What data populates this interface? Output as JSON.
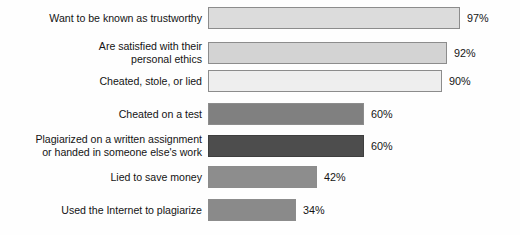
{
  "chart_data": {
    "type": "bar",
    "orientation": "horizontal",
    "title": "",
    "subtitle": "",
    "xlabel": "",
    "ylabel": "",
    "xlim": [
      0,
      100
    ],
    "grid": false,
    "legend": null,
    "units": "%",
    "categories": [
      "Want to be known as trustworthy",
      "Are satisfied with their\npersonal ethics",
      "Cheated, stole, or lied",
      "Cheated on a test",
      "Plagiarized on a written assignment\nor handed in someone else's work",
      "Lied to save money",
      "Used the Internet to plagiarize"
    ],
    "values": [
      97,
      92,
      90,
      60,
      60,
      42,
      34
    ],
    "value_labels": [
      "97%",
      "92%",
      "90%",
      "60%",
      "60%",
      "42%",
      "34%"
    ],
    "bar_colors": [
      "#dcdcdc",
      "#d3d3d3",
      "#eeeeee",
      "#808080",
      "#4d4d4d",
      "#8d8d8d",
      "#8a8a8a"
    ],
    "bars": [
      {
        "label": "Want to be known as trustworthy",
        "value": 97,
        "value_label": "97%",
        "color": "#dcdcdc",
        "dark": false
      },
      {
        "label": "Are satisfied with their\npersonal ethics",
        "value": 92,
        "value_label": "92%",
        "color": "#d3d3d3",
        "dark": false
      },
      {
        "label": "Cheated, stole, or lied",
        "value": 90,
        "value_label": "90%",
        "color": "#eeeeee",
        "dark": false
      },
      {
        "label": "Cheated on a test",
        "value": 60,
        "value_label": "60%",
        "color": "#808080",
        "dark": false
      },
      {
        "label": "Plagiarized on a written assignment\nor handed in someone else's work",
        "value": 60,
        "value_label": "60%",
        "color": "#4d4d4d",
        "dark": true
      },
      {
        "label": "Lied to save money",
        "value": 42,
        "value_label": "42%",
        "color": "#8d8d8d",
        "dark": false
      },
      {
        "label": "Used the Internet to plagiarize",
        "value": 34,
        "value_label": "34%",
        "color": "#8a8a8a",
        "dark": false
      }
    ],
    "layout": {
      "bar_origin_x": 214,
      "px_per_percent": 2.6,
      "bar_height": 22,
      "row_tops": [
        7,
        40,
        70,
        103,
        133,
        166,
        199
      ]
    }
  }
}
